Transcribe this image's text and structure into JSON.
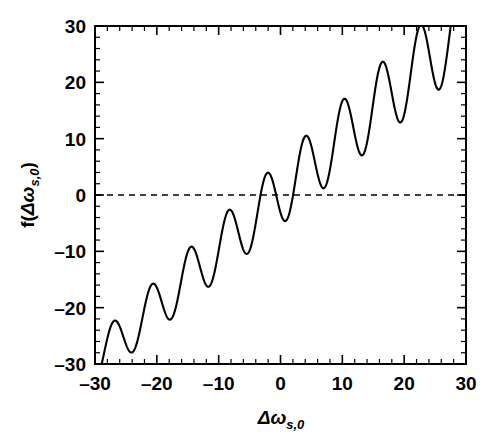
{
  "figure": {
    "background_color": "#ffffff",
    "line_color": "#000000"
  },
  "axis": {
    "x_title_main": "Δω",
    "x_title_sub": "s,0",
    "y_title_prefix": "f(",
    "y_title_main": "Δω",
    "y_title_sub": "s,0",
    "y_title_suffix": ")",
    "x_tick_labels": [
      "–30",
      "–20",
      "–10",
      "0",
      "10",
      "20",
      "30"
    ],
    "y_tick_labels": [
      "30",
      "20",
      "10",
      "0",
      "–10",
      "–20",
      "–30"
    ]
  },
  "chart_data": {
    "type": "line",
    "title": "",
    "subtitle": "",
    "xlabel": "Δω_s,0",
    "ylabel": "f(Δω_s,0)",
    "xlim": [
      -30,
      30
    ],
    "ylim": [
      -30,
      30
    ],
    "x_major_ticks": [
      -30,
      -20,
      -10,
      0,
      10,
      20,
      30
    ],
    "y_major_ticks": [
      -30,
      -20,
      -10,
      0,
      10,
      20,
      30
    ],
    "x_minor_tick_step": 2,
    "y_minor_tick_step": 2,
    "grid": false,
    "legend": null,
    "legend_position": "none",
    "annotations": [
      {
        "name": "zero-reference-line",
        "kind": "horizontal-dashed-line",
        "y": 0,
        "style": "dashed",
        "color": "#000000"
      }
    ],
    "model": {
      "form": "y = slope*x + offset + amplitude(x)*cos(2*pi*(x - phase)/period)",
      "slope": 1.0,
      "offset": 0.4,
      "period": 6.2,
      "phase": -27.0,
      "amplitude_at_xmin": 4.0,
      "amplitude_at_xmax": 7.6
    },
    "peaks": [
      {
        "x": -27.0,
        "y": -21.1
      },
      {
        "x": -20.8,
        "y": -14.6
      },
      {
        "x": -14.6,
        "y": -8.3
      },
      {
        "x": -8.4,
        "y": -1.9
      },
      {
        "x": -2.2,
        "y": 4.6
      },
      {
        "x": 4.0,
        "y": 11.0
      },
      {
        "x": 10.2,
        "y": 17.3
      },
      {
        "x": 16.4,
        "y": 23.7
      },
      {
        "x": 22.6,
        "y": 30.4
      },
      {
        "x": 28.8,
        "y": 36.8
      }
    ],
    "troughs": [
      {
        "x": -23.9,
        "y": -30.6
      },
      {
        "x": -17.7,
        "y": -25.1
      },
      {
        "x": -11.5,
        "y": -18.8
      },
      {
        "x": -5.3,
        "y": -12.7
      },
      {
        "x": 0.9,
        "y": -6.4
      },
      {
        "x": 7.1,
        "y": -0.2
      },
      {
        "x": 13.3,
        "y": 6.1
      },
      {
        "x": 19.5,
        "y": 12.4
      },
      {
        "x": 25.7,
        "y": 18.8
      }
    ],
    "zero_crossings_approx": [
      -24.5,
      -23.2,
      -7.5,
      6.9,
      7.3
    ],
    "x": [
      -30,
      -29,
      -28,
      -27,
      -26,
      -25,
      -24,
      -23,
      -22,
      -21,
      -20,
      -19,
      -18,
      -17,
      -16,
      -15,
      -14,
      -13,
      -12,
      -11,
      -10,
      -9,
      -8,
      -7,
      -6,
      -5,
      -4,
      -3,
      -2,
      -1,
      0,
      1,
      2,
      3,
      4,
      5,
      6,
      7,
      8,
      9,
      10,
      11,
      12,
      13,
      14,
      15,
      16,
      17,
      18,
      19,
      20,
      21,
      22,
      23,
      24,
      25,
      26,
      27,
      28,
      29,
      30
    ],
    "y": [
      -32.6,
      -27.5,
      -23.7,
      -21.1,
      -22.1,
      -26.3,
      -30.4,
      -29.7,
      -25.6,
      -21.5,
      -19.2,
      -20.6,
      -24.7,
      -27.6,
      -26.1,
      -22.3,
      -19.0,
      -18.5,
      -21.6,
      -25.6,
      -26.6,
      -23.9,
      -19.9,
      -17.0,
      -17.3,
      -20.8,
      -24.6,
      -25.2,
      -22.0,
      -17.7,
      -14.4,
      -14.6,
      -17.9,
      -22.2,
      -24.2,
      -22.3,
      -17.8,
      -13.6,
      -11.8,
      -13.3,
      -17.1,
      -20.5,
      -20.8,
      -17.8,
      -13.5,
      -10.6,
      -10.8,
      -14.1,
      -18.0,
      -19.6,
      -17.8,
      -13.8,
      -10.0,
      -8.5,
      -10.2,
      -13.9,
      -17.3,
      -18.0,
      -15.5,
      -11.4,
      -7.9
    ]
  }
}
